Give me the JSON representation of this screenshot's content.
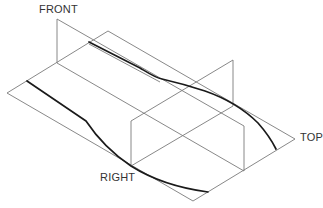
{
  "diagram": {
    "type": "orthographic-projection-planes",
    "labels": {
      "front": "FRONT",
      "right": "RIGHT",
      "top": "TOP"
    },
    "colors": {
      "plane_edge": "#7a7a7a",
      "curve": "#1a1a1a",
      "label": "#333333"
    },
    "planes": {
      "top": [
        [
          7,
          93
        ],
        [
          108,
          31
        ],
        [
          295,
          139
        ],
        [
          193,
          201
        ]
      ],
      "front": [
        [
          57,
          19
        ],
        [
          57,
          63
        ],
        [
          244,
          171
        ],
        [
          244,
          126
        ]
      ],
      "right": [
        [
          131,
          121
        ],
        [
          233,
          60
        ],
        [
          233,
          106
        ],
        [
          131,
          166
        ]
      ]
    }
  }
}
